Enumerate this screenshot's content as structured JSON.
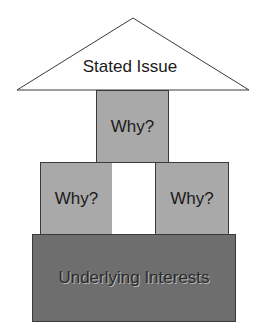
{
  "diagram": {
    "roof": {
      "label": "Stated Issue"
    },
    "pillars": [
      {
        "label": "Why?",
        "position": "top-center"
      },
      {
        "label": "Why?",
        "position": "middle-left"
      },
      {
        "label": "Why?",
        "position": "middle-right"
      }
    ],
    "foundation": {
      "label": "Underlying Interests"
    },
    "colors": {
      "roof_fill": "#ffffff",
      "pillar_fill": "#a9a9a9",
      "foundation_fill": "#6e6e6e",
      "outline": "#3a3a3a"
    }
  }
}
